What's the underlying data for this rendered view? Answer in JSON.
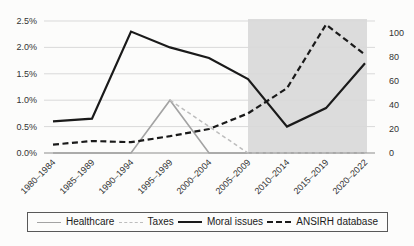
{
  "chart_data": {
    "type": "line",
    "title": "",
    "xlabel": "",
    "ylabel_left": "",
    "ylabel_right": "",
    "categories": [
      "1980–1984",
      "1985–1989",
      "1990–1994",
      "1995–1999",
      "2000–2004",
      "2005–2009",
      "2010–2014",
      "2015–2019",
      "2020–2022"
    ],
    "series": [
      {
        "name": "Healthcare",
        "axis": "left",
        "style": "solid",
        "color": "#a3a3a3",
        "stroke_width": 1.6,
        "values": [
          0,
          0,
          0,
          1.0,
          0,
          0,
          0,
          0,
          0
        ]
      },
      {
        "name": "Taxes",
        "axis": "left",
        "style": "dashed",
        "color": "#bdbdbd",
        "stroke_width": 1.5,
        "values": [
          null,
          null,
          null,
          1.0,
          0.5,
          0,
          0,
          0,
          0
        ]
      },
      {
        "name": "Moral issues",
        "axis": "left",
        "style": "solid",
        "color": "#1a1a1a",
        "stroke_width": 2.2,
        "values": [
          0.6,
          0.65,
          2.3,
          2.0,
          1.8,
          1.4,
          0.5,
          0.85,
          1.7
        ]
      },
      {
        "name": "ANSIRH database",
        "axis": "right",
        "style": "dashed",
        "color": "#1a1a1a",
        "stroke_width": 2.2,
        "values": [
          7,
          10,
          9,
          14,
          20,
          33,
          54,
          107,
          82
        ]
      }
    ],
    "left_axis": {
      "tick_labels": [
        "0.0%",
        "0.5%",
        "1.0%",
        "1.5%",
        "2.0%",
        "2.5%"
      ],
      "min": 0,
      "max": 2.5
    },
    "right_axis": {
      "tick_labels": [
        "0",
        "20",
        "40",
        "60",
        "80",
        "100"
      ],
      "min": 0,
      "max": 110
    },
    "grid": true,
    "gridline_color": "#d9d9d9",
    "axis_line_color": "#8c8c8c",
    "tick_label_color": "#333333",
    "shaded_region": {
      "from_category": "2005–2009",
      "to_category": "2020–2022",
      "color": "#dcdcdc"
    },
    "legend_position": "bottom"
  }
}
